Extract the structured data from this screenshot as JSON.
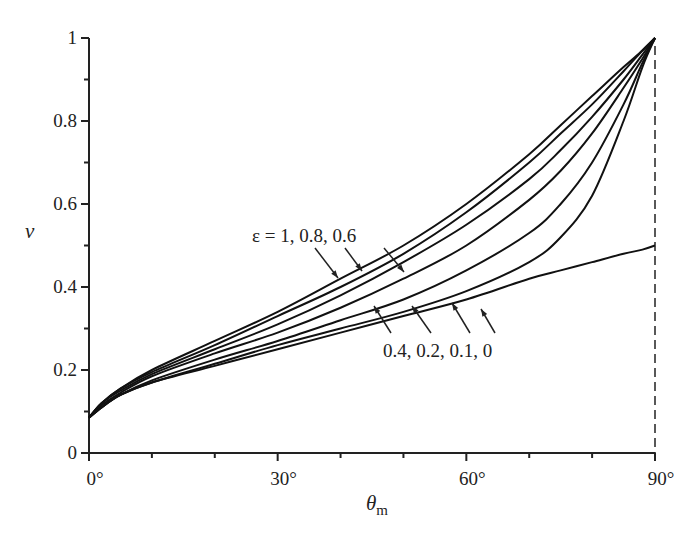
{
  "chart_data": {
    "type": "line",
    "title": "",
    "xlabel": "θ",
    "xlabel_subscript": "m",
    "ylabel": "v",
    "xlim": [
      0,
      90
    ],
    "ylim": [
      0,
      1
    ],
    "x_ticks": [
      0,
      30,
      60,
      90
    ],
    "x_tick_labels": [
      "0°",
      "30°",
      "60°",
      "90°"
    ],
    "x_minor_step": 10,
    "y_ticks": [
      0,
      0.2,
      0.4,
      0.6,
      0.8,
      1
    ],
    "y_tick_labels": [
      "0",
      "0.2",
      "0.4",
      "0.6",
      "0.8",
      "1"
    ],
    "y_minor_step": 0.1,
    "grid": false,
    "legend": "none (inline annotations)",
    "vertical_dashed_line_x": 90,
    "annotations": [
      {
        "text": "ε = 1, 0.8, 0.6",
        "refers_to": [
          "ε=1",
          "ε=0.8",
          "ε=0.6"
        ]
      },
      {
        "text": "0.4, 0.2, 0.1, 0",
        "refers_to": [
          "ε=0.4",
          "ε=0.2",
          "ε=0.1",
          "ε=0"
        ]
      }
    ],
    "x": [
      0,
      2,
      5,
      10,
      20,
      30,
      40,
      50,
      60,
      70,
      75,
      80,
      85,
      88,
      90
    ],
    "series": [
      {
        "name": "ε=1",
        "values": [
          0.085,
          0.12,
          0.155,
          0.2,
          0.27,
          0.34,
          0.42,
          0.5,
          0.6,
          0.72,
          0.79,
          0.86,
          0.93,
          0.97,
          1.0
        ]
      },
      {
        "name": "ε=0.8",
        "values": [
          0.085,
          0.12,
          0.155,
          0.195,
          0.26,
          0.33,
          0.4,
          0.48,
          0.58,
          0.7,
          0.77,
          0.84,
          0.92,
          0.97,
          1.0
        ]
      },
      {
        "name": "ε=0.6",
        "values": [
          0.085,
          0.12,
          0.15,
          0.19,
          0.25,
          0.31,
          0.38,
          0.46,
          0.55,
          0.66,
          0.73,
          0.81,
          0.9,
          0.96,
          1.0
        ]
      },
      {
        "name": "ε=0.4",
        "values": [
          0.085,
          0.115,
          0.145,
          0.185,
          0.24,
          0.29,
          0.35,
          0.42,
          0.5,
          0.61,
          0.68,
          0.77,
          0.88,
          0.95,
          1.0
        ]
      },
      {
        "name": "ε=0.2",
        "values": [
          0.085,
          0.11,
          0.14,
          0.175,
          0.225,
          0.27,
          0.32,
          0.37,
          0.44,
          0.53,
          0.6,
          0.7,
          0.84,
          0.94,
          1.0
        ]
      },
      {
        "name": "ε=0.1",
        "values": [
          0.085,
          0.11,
          0.14,
          0.17,
          0.215,
          0.26,
          0.3,
          0.34,
          0.39,
          0.46,
          0.52,
          0.62,
          0.8,
          0.93,
          1.0
        ]
      },
      {
        "name": "ε=0",
        "values": [
          0.085,
          0.11,
          0.14,
          0.17,
          0.21,
          0.25,
          0.29,
          0.33,
          0.37,
          0.42,
          0.44,
          0.46,
          0.48,
          0.49,
          0.5
        ]
      }
    ],
    "colors": {
      "line": "#111111",
      "axis": "#222222",
      "text": "#222222"
    }
  }
}
